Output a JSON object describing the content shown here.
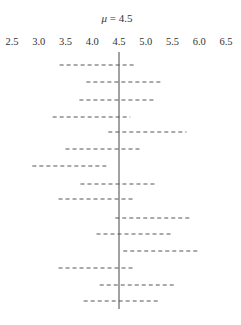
{
  "chart_data": {
    "type": "interval-plot",
    "title": "μ = 4.5",
    "title_symbol": "μ",
    "title_value": "= 4.5",
    "xlabel": "",
    "ylabel": "",
    "xlim": [
      2.5,
      6.5
    ],
    "x_ticks": [
      "2.5",
      "3.0",
      "3.5",
      "4.0",
      "4.5",
      "5.0",
      "5.5",
      "6.0",
      "6.5"
    ],
    "reference_line": 4.5,
    "grid": false,
    "legend": null,
    "intervals": [
      {
        "lower": 3.39,
        "upper": 4.81
      },
      {
        "lower": 3.89,
        "upper": 5.28
      },
      {
        "lower": 3.76,
        "upper": 5.16
      },
      {
        "lower": 3.26,
        "upper": 4.71
      },
      {
        "lower": 4.3,
        "upper": 5.76
      },
      {
        "lower": 3.5,
        "upper": 4.9
      },
      {
        "lower": 2.88,
        "upper": 4.27
      },
      {
        "lower": 3.78,
        "upper": 5.2
      },
      {
        "lower": 3.37,
        "upper": 4.79
      },
      {
        "lower": 4.43,
        "upper": 5.84
      },
      {
        "lower": 4.08,
        "upper": 5.5
      },
      {
        "lower": 4.58,
        "upper": 6.0
      },
      {
        "lower": 3.37,
        "upper": 4.79
      },
      {
        "lower": 4.14,
        "upper": 5.56
      },
      {
        "lower": 3.84,
        "upper": 5.26
      }
    ],
    "interval_style": "dashed",
    "colors": {
      "line": "#555555",
      "text": "#333333"
    }
  }
}
